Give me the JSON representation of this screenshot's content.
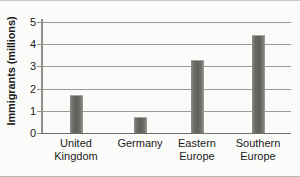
{
  "chart_data": {
    "type": "bar",
    "title": "",
    "xlabel": "",
    "ylabel": "Immigrants (millions)",
    "categories": [
      "United Kingdom",
      "Germany",
      "Eastern Europe",
      "Southern Europe"
    ],
    "category_lines": [
      [
        "United",
        "Kingdom"
      ],
      [
        "Germany",
        ""
      ],
      [
        "Eastern",
        "Europe"
      ],
      [
        "Southern",
        "Europe"
      ]
    ],
    "values": [
      1.65,
      0.67,
      3.25,
      4.37
    ],
    "ylim": [
      0,
      5
    ],
    "yticks": [
      0,
      1,
      2,
      3,
      4,
      5
    ],
    "ytick_labels": [
      "0",
      "1",
      "2",
      "3",
      "4",
      "5"
    ],
    "grid": true,
    "legend": "none",
    "bar_color": "#6a6a67",
    "gridline_color": "#9b9b98",
    "axis_color": "#8d8d8a",
    "background_color": "#fbfbfa",
    "text_color": "#1b1b1b"
  }
}
